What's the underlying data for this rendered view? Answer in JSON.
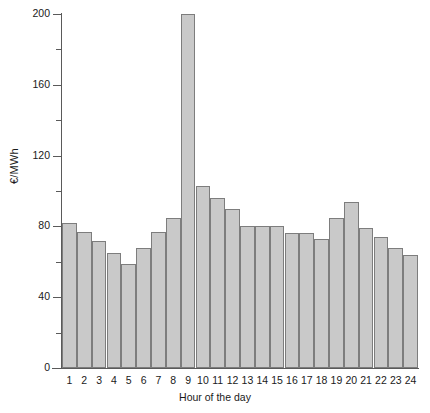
{
  "chart_data": {
    "type": "bar",
    "title": "",
    "xlabel": "Hour of the day",
    "ylabel": "€/MWh",
    "categories": [
      "1",
      "2",
      "3",
      "4",
      "5",
      "6",
      "7",
      "8",
      "9",
      "10",
      "11",
      "12",
      "13",
      "14",
      "15",
      "16",
      "17",
      "18",
      "19",
      "20",
      "21",
      "22",
      "23",
      "24"
    ],
    "values": [
      82,
      77,
      72,
      65,
      59,
      68,
      77,
      85,
      200,
      103,
      96,
      90,
      80,
      80,
      80,
      76,
      76,
      73,
      85,
      94,
      79,
      74,
      68,
      64
    ],
    "ylim": [
      0,
      200
    ],
    "xlim_note": "categorical hours 1 through 24",
    "yticks_major": [
      0,
      40,
      80,
      120,
      160,
      200
    ],
    "yticks_minor": [
      20,
      60,
      100,
      140,
      180
    ],
    "grid": false,
    "legend": "none",
    "series": [
      {
        "name": "Price",
        "values": [
          82,
          77,
          72,
          65,
          59,
          68,
          77,
          85,
          200,
          103,
          96,
          90,
          80,
          80,
          80,
          76,
          76,
          73,
          85,
          94,
          79,
          74,
          68,
          64
        ]
      }
    ],
    "bar_fill_color": "#c9c9c9",
    "bar_edge_color": "#7d7d7d",
    "axis_color": "#5a5a5a",
    "background_color": "#ffffff"
  }
}
